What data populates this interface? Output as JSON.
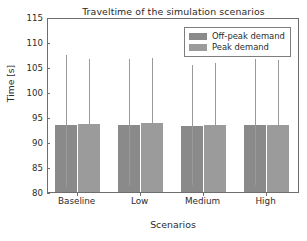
{
  "chart_data": {
    "type": "bar",
    "title": "Traveltime of the simulation scenarios",
    "xlabel": "Scenarios",
    "ylabel": "Time [s]",
    "categories": [
      "Baseline",
      "Low",
      "Medium",
      "High"
    ],
    "ylim": [
      80,
      115
    ],
    "yticks": [
      80,
      85,
      90,
      95,
      100,
      105,
      110,
      115
    ],
    "grid": false,
    "legend_position": "upper right",
    "errorbars": true,
    "series": [
      {
        "name": "Off-peak demand",
        "color": "#8a8a8a",
        "values": [
          93.8,
          93.9,
          93.6,
          93.8
        ],
        "err_high": [
          107.8,
          107.0,
          105.9,
          107.0
        ],
        "err_low": [
          81.4,
          81.6,
          81.8,
          81.8
        ]
      },
      {
        "name": "Peak demand",
        "color": "#9b9b9b",
        "values": [
          94.1,
          94.2,
          93.9,
          93.8
        ],
        "err_high": [
          107.0,
          107.3,
          106.2,
          106.8
        ],
        "err_low": [
          81.5,
          81.3,
          82.1,
          81.8
        ]
      }
    ]
  },
  "legend": {
    "items": [
      {
        "label": "Off-peak demand",
        "color": "#8a8a8a"
      },
      {
        "label": "Peak demand",
        "color": "#9b9b9b"
      }
    ]
  }
}
